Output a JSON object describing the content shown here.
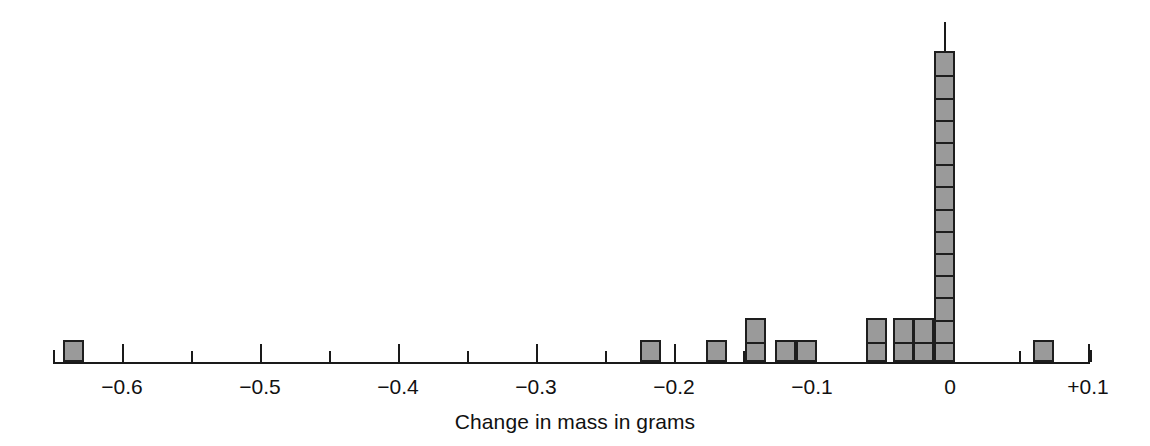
{
  "chart_data": {
    "type": "bar",
    "title": "",
    "subtitle": "",
    "xlabel": "Change in mass in grams",
    "ylabel": "",
    "grid": false,
    "legend": null,
    "note": "Dot-style stacked histogram; each outlined cell in a bar represents one observation (count of 1).",
    "xlim": [
      -0.65,
      0.1
    ],
    "ylim": [
      0,
      14
    ],
    "xticks_major": [
      -0.6,
      -0.5,
      -0.4,
      -0.3,
      -0.2,
      -0.1,
      0,
      0.1
    ],
    "xtick_labels": [
      "−0.6",
      "−0.5",
      "−0.4",
      "−0.3",
      "−0.2",
      "−0.1",
      "0",
      "+0.1"
    ],
    "xticks_minor": [
      -0.65,
      -0.55,
      -0.45,
      -0.35,
      -0.25,
      -0.15,
      -0.05,
      0.05
    ],
    "bin_width": 0.015,
    "categories": [
      -0.635,
      -0.217,
      -0.169,
      -0.141,
      -0.119,
      -0.104,
      -0.053,
      -0.034,
      -0.019,
      -0.004,
      0.068
    ],
    "values": [
      1,
      1,
      1,
      2,
      1,
      1,
      2,
      2,
      2,
      14,
      1
    ],
    "bars": [
      {
        "center": -0.635,
        "count": 1
      },
      {
        "center": -0.217,
        "count": 1
      },
      {
        "center": -0.169,
        "count": 1
      },
      {
        "center": -0.141,
        "count": 2
      },
      {
        "center": -0.119,
        "count": 1
      },
      {
        "center": -0.104,
        "count": 1
      },
      {
        "center": -0.053,
        "count": 2
      },
      {
        "center": -0.034,
        "count": 2
      },
      {
        "center": -0.019,
        "count": 2
      },
      {
        "center": -0.004,
        "count": 14
      },
      {
        "center": 0.068,
        "count": 1
      }
    ],
    "total_observations": 28,
    "colors": {
      "bar_fill": "#9a9a9a",
      "bar_stroke": "#1e1e1e",
      "axis": "#1a1a1a",
      "text": "#111111",
      "background": "#ffffff"
    }
  },
  "figure": {
    "axis_title": "Change in mass in grams"
  }
}
